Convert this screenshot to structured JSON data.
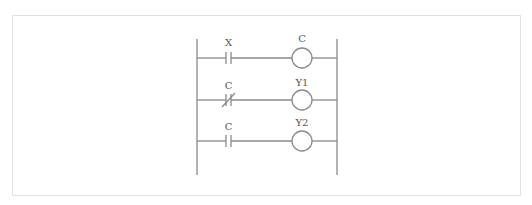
{
  "diagram": {
    "type": "ladder-logic",
    "colors": {
      "line": "#8a8a8a",
      "text": "#555555",
      "frame": "#e2e2e2"
    },
    "rungs": [
      {
        "contact_label": "X",
        "contact_type": "normally-open",
        "coil_label": "C"
      },
      {
        "contact_label": "C",
        "contact_type": "normally-closed",
        "coil_label": "Y1"
      },
      {
        "contact_label": "C",
        "contact_type": "normally-open",
        "coil_label": "Y2"
      }
    ]
  }
}
